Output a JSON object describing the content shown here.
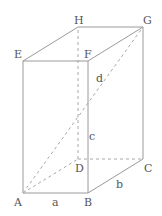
{
  "diagram": {
    "vertices": {
      "A": {
        "label": "A",
        "x": 23,
        "y": 193
      },
      "B": {
        "label": "B",
        "x": 88,
        "y": 193
      },
      "C": {
        "label": "C",
        "x": 143,
        "y": 159
      },
      "D": {
        "label": "D",
        "x": 78,
        "y": 159
      },
      "E": {
        "label": "E",
        "x": 23,
        "y": 61
      },
      "F": {
        "label": "F",
        "x": 88,
        "y": 61
      },
      "G": {
        "label": "G",
        "x": 143,
        "y": 27
      },
      "H": {
        "label": "H",
        "x": 78,
        "y": 27
      }
    },
    "edge_labels": {
      "a": "a",
      "b": "b",
      "c": "c",
      "d": "d"
    },
    "colors": {
      "line": "#9a9a9a",
      "dashed": "#a8a8a8",
      "text": "#555555"
    }
  }
}
